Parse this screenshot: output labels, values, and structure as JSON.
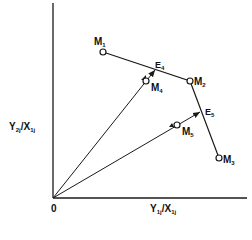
{
  "diagram": {
    "type": "frontier-diagram",
    "axes": {
      "x_label": {
        "main": "Y",
        "sub1": "1j",
        "sep": "/X",
        "sub2": "1j"
      },
      "y_label": {
        "main": "Y",
        "sub1": "2j",
        "sep": "/X",
        "sub2": "1j"
      },
      "origin_label": "0"
    },
    "points": [
      {
        "id": "M1",
        "main": "M",
        "sub": "1"
      },
      {
        "id": "M2",
        "main": "M",
        "sub": "2"
      },
      {
        "id": "M3",
        "main": "M",
        "sub": "3"
      },
      {
        "id": "M4",
        "main": "M",
        "sub": "4"
      },
      {
        "id": "M5",
        "main": "M",
        "sub": "5"
      },
      {
        "id": "E4",
        "main": "E",
        "sub": "4"
      },
      {
        "id": "E5",
        "main": "E",
        "sub": "5"
      }
    ],
    "frontier": [
      "M1",
      "M2",
      "M3"
    ],
    "rays": [
      {
        "from": "0",
        "through": "M4",
        "to": "E4"
      },
      {
        "from": "0",
        "through": "M5",
        "to": "E5"
      }
    ],
    "line_color": "#1a1a1a"
  }
}
